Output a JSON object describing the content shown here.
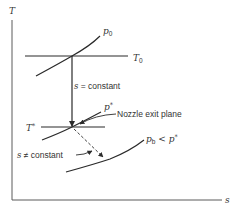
{
  "diagram": {
    "axes": {
      "y_label": "T",
      "x_label": "s"
    },
    "curves": {
      "p0": {
        "label": "p",
        "subscript": "0"
      },
      "p_star": {
        "label": "p",
        "superscript": "*"
      },
      "pb": {
        "label": "p",
        "subscript": "b",
        "relation": " < p",
        "relation_sup": "*"
      }
    },
    "isotherms": {
      "T0": {
        "label": "T",
        "subscript": "0"
      },
      "T_star": {
        "label": "T",
        "superscript": "*"
      }
    },
    "annotations": {
      "isentropic": {
        "symbol": "s",
        "text": " = constant"
      },
      "non_isentropic": {
        "symbol": "s",
        "text": " ≠ constant"
      },
      "nozzle_exit": "Nozzle exit plane"
    },
    "colors": {
      "line": "#2a2a2a",
      "axis": "#5a5a5a",
      "text": "#333333",
      "background": "#ffffff"
    }
  }
}
